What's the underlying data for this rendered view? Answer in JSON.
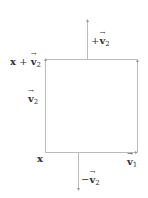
{
  "diagram": {
    "labels": {
      "top_arrow": {
        "sign": "+",
        "vec": "v",
        "sub": "2"
      },
      "top_left_corner": {
        "base": "x",
        "op": " + ",
        "vec": "v",
        "sub": "2"
      },
      "left_side": {
        "vec": "v",
        "sub": "2"
      },
      "origin": {
        "base": "x"
      },
      "right_bottom": {
        "vec": "v",
        "sub": "1"
      },
      "bottom_arrow": {
        "sign": "−",
        "vec": "v",
        "sub": "2"
      }
    },
    "colors": {
      "line": "#bbbbbb",
      "text": "#333333",
      "background": "#ffffff"
    }
  }
}
